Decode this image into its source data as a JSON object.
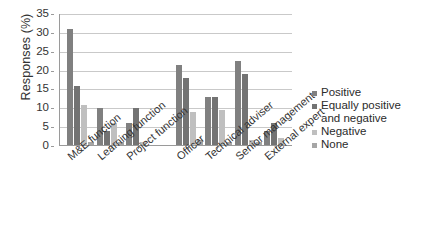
{
  "chart_data": {
    "type": "bar",
    "title": "",
    "subtitle": "",
    "xlabel": "",
    "ylabel": "Responses (%)",
    "ylim": [
      0,
      35
    ],
    "yticks": [
      0,
      5,
      10,
      15,
      20,
      25,
      30,
      35
    ],
    "ytick_labels": [
      "0",
      "5",
      "10",
      "15",
      "20",
      "25",
      "30",
      "35"
    ],
    "grid": true,
    "legend_position": "right",
    "group_gap_after_index": 2,
    "categories": [
      "M&E function",
      "Learning function",
      "Project function",
      "Officer",
      "Technical adviser",
      "Senior management",
      "External expert"
    ],
    "series": [
      {
        "name": "Positive",
        "color": "#808080",
        "values": [
          31,
          10,
          6,
          21.5,
          13,
          22.5,
          4
        ]
      },
      {
        "name": "Equally positive and negative",
        "color": "#737373",
        "values": [
          16,
          4,
          10,
          18,
          13,
          19,
          6
        ]
      },
      {
        "name": "Negative",
        "color": "#bfbfbf",
        "values": [
          11,
          6,
          1,
          9,
          9.5,
          1.5,
          2
        ]
      },
      {
        "name": "None",
        "color": "#a6a6a6",
        "values": [
          1,
          1,
          0,
          1.5,
          1,
          1,
          0
        ]
      }
    ]
  },
  "legend": {
    "entries": [
      {
        "label": "Positive"
      },
      {
        "label": "Equally positive"
      },
      {
        "label": "and negative"
      },
      {
        "label": "Negative"
      },
      {
        "label": "None"
      }
    ]
  },
  "axis": {
    "y_title": "Responses (%)"
  }
}
